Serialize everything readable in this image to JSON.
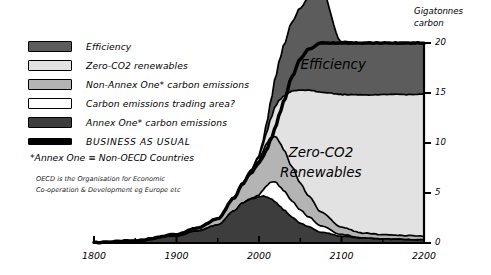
{
  "legend": {
    "items": [
      {
        "label": "Efficiency",
        "color": "#5c5c5c",
        "style": "normal"
      },
      {
        "label": "Zero-CO2 renewables",
        "color": "#e2e2e2",
        "style": "normal"
      },
      {
        "label": "Non-Annex One* carbon emissions",
        "color": "#b4b4b4",
        "style": "normal"
      },
      {
        "label": "Carbon emissions trading area?",
        "color": "#ffffff",
        "style": "normal"
      },
      {
        "label": "Annex One* carbon emissions",
        "color": "#3d3d3d",
        "style": "normal"
      },
      {
        "label": "BUSINESS AS USUAL",
        "color": "#000000",
        "style": "thin"
      }
    ],
    "footnote": "*Annex One ≡ Non-OECD Countries",
    "subnote_line1": "OECD is the Organisation for Economic",
    "subnote_line2": "Co-operation & Development eg Europe etc"
  },
  "chart_data": {
    "type": "area",
    "title": "",
    "xlabel": "",
    "ylabel": "Gigatonnes carbon",
    "ylabel_line1": "Gigatonnes",
    "ylabel_line2": "carbon",
    "xlim": [
      1800,
      2200
    ],
    "ylim": [
      0,
      20
    ],
    "xticks": [
      1800,
      1900,
      2000,
      2100,
      2200
    ],
    "xtick_labels": [
      "1800",
      "1900",
      "2000",
      "2100",
      "2200"
    ],
    "xminor": [
      1850,
      1950,
      2050,
      2150
    ],
    "yticks": [
      0,
      5,
      10,
      15,
      20
    ],
    "ytick_labels": [
      "0",
      "5",
      "10",
      "15",
      "20"
    ],
    "grid": false,
    "legend_position": "upper-left-outside",
    "stacked": true,
    "annotations": [
      {
        "text": "Efficiency",
        "x": 2090,
        "y": 17.4
      },
      {
        "text": "Zero-CO2",
        "x": 2075,
        "y": 8.6
      },
      {
        "text": "Renewables",
        "x": 2075,
        "y": 6.6
      }
    ],
    "x": [
      1800,
      1850,
      1900,
      1925,
      1950,
      1970,
      1980,
      1990,
      2000,
      2005,
      2010,
      2015,
      2020,
      2025,
      2030,
      2040,
      2050,
      2060,
      2075,
      2100,
      2125,
      2150,
      2175,
      2200
    ],
    "series": [
      {
        "name": "Annex One* carbon emissions",
        "values": [
          0.05,
          0.2,
          0.7,
          1.2,
          1.8,
          3.2,
          4.0,
          4.4,
          4.6,
          4.7,
          4.6,
          4.4,
          4.1,
          3.7,
          3.3,
          2.6,
          2.0,
          1.6,
          1.1,
          0.7,
          0.5,
          0.4,
          0.35,
          0.3
        ]
      },
      {
        "name": "Carbon emissions trading area?",
        "values": [
          0,
          0,
          0,
          0,
          0,
          0,
          0,
          0.05,
          0.2,
          0.6,
          1.2,
          1.7,
          2.0,
          2.0,
          1.9,
          1.6,
          1.3,
          1.0,
          0.6,
          0.15,
          0,
          0,
          0,
          0
        ]
      },
      {
        "name": "Non-Annex One* carbon emissions",
        "values": [
          0,
          0.03,
          0.15,
          0.3,
          0.6,
          1.3,
          1.9,
          2.6,
          3.4,
          3.9,
          4.3,
          4.5,
          4.6,
          4.4,
          4.1,
          3.4,
          2.7,
          2.1,
          1.4,
          0.7,
          0.5,
          0.45,
          0.4,
          0.4
        ]
      },
      {
        "name": "Zero-CO2 renewables",
        "values": [
          0,
          0,
          0,
          0,
          0,
          0.05,
          0.1,
          0.2,
          0.4,
          0.7,
          1.2,
          2.0,
          3.0,
          4.2,
          5.4,
          7.6,
          9.3,
          10.6,
          12.0,
          13.3,
          13.8,
          14.0,
          14.1,
          14.2
        ]
      },
      {
        "name": "Efficiency",
        "values": [
          0,
          0,
          0,
          0,
          0,
          0,
          0,
          0,
          0.1,
          0.4,
          1.0,
          1.9,
          2.9,
          4.0,
          5.1,
          6.9,
          8.2,
          9.2,
          10.3,
          5.3,
          5.2,
          5.15,
          5.1,
          5.1
        ]
      }
    ],
    "business_as_usual": {
      "name": "BUSINESS AS USUAL",
      "x": [
        1800,
        1850,
        1900,
        1925,
        1950,
        1970,
        1980,
        1990,
        2000,
        2005,
        2010,
        2015,
        2020,
        2025,
        2030,
        2040,
        2050,
        2060,
        2075,
        2090,
        2100
      ],
      "values": [
        0.05,
        0.23,
        0.85,
        1.5,
        2.4,
        4.5,
        5.9,
        7.0,
        8.0,
        8.7,
        9.5,
        10.5,
        11.6,
        12.9,
        14.2,
        16.6,
        18.4,
        19.4,
        20.0,
        20.0,
        20.0
      ]
    }
  }
}
